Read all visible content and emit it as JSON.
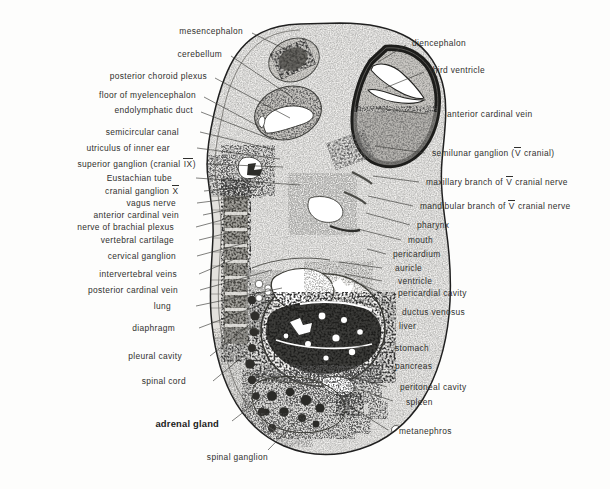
{
  "plate": {
    "width": 610,
    "height": 489,
    "background": "#fdfdfc",
    "ink": "#30302e",
    "specimen_name": "mammalian embryo sagittal section",
    "description": "Histological sagittal section of a mammalian embryo with labelled leader lines."
  },
  "labels_left": [
    {
      "text": "mesencephalon",
      "x": 243,
      "y": 31,
      "lx": 252,
      "ly": 33,
      "tx": 297,
      "ty": 55
    },
    {
      "text": "cerebellum",
      "x": 222,
      "y": 54,
      "lx": 231,
      "ly": 56,
      "tx": 292,
      "ty": 97
    },
    {
      "text": "posterior  choroid plexus",
      "x": 207,
      "y": 76,
      "lx": 215,
      "ly": 78,
      "tx": 290,
      "ty": 118
    },
    {
      "text": "floor of myelencephalon",
      "x": 196,
      "y": 95,
      "lx": 204,
      "ly": 97,
      "tx": 262,
      "ty": 128
    },
    {
      "text": "endolymphatic  duct",
      "x": 193,
      "y": 110,
      "lx": 201,
      "ly": 112,
      "tx": 273,
      "ty": 140
    },
    {
      "text": "semicircular canal",
      "x": 179,
      "y": 132,
      "lx": 200,
      "ly": 132,
      "tx": 275,
      "ty": 150
    },
    {
      "text": "utriculus  of inner ear",
      "x": 170,
      "y": 148,
      "lx": 197,
      "ly": 148,
      "tx": 280,
      "ty": 159
    },
    {
      "text": "superior ganglion (cranial IX)",
      "x": 196,
      "y": 164,
      "lx": 206,
      "ly": 164,
      "tx": 283,
      "ty": 167,
      "roman": "IX"
    },
    {
      "text": "Eustachian tube",
      "x": 172,
      "y": 178,
      "lx": 196,
      "ly": 178,
      "tx": 300,
      "ty": 185
    },
    {
      "text": "cranial  ganglion X",
      "x": 179,
      "y": 191,
      "lx": 204,
      "ly": 191,
      "tx": 256,
      "ty": 186,
      "roman": "X"
    },
    {
      "text": "vagus nerve",
      "x": 176,
      "y": 203,
      "lx": 197,
      "ly": 203,
      "tx": 252,
      "ty": 196
    },
    {
      "text": "anterior cardinal vein",
      "x": 179,
      "y": 215,
      "lx": 203,
      "ly": 215,
      "tx": 236,
      "ty": 208
    },
    {
      "text": "nerve of brachial  plexus",
      "x": 174,
      "y": 227,
      "lx": 196,
      "ly": 227,
      "tx": 226,
      "ty": 219
    },
    {
      "text": "vertebral cartilage",
      "x": 174,
      "y": 240,
      "lx": 199,
      "ly": 240,
      "tx": 232,
      "ty": 232
    },
    {
      "text": "cervical ganglion",
      "x": 176,
      "y": 256,
      "lx": 197,
      "ly": 256,
      "tx": 245,
      "ty": 243
    },
    {
      "text": "intervertebral veins",
      "x": 177,
      "y": 274,
      "lx": 199,
      "ly": 274,
      "tx": 237,
      "ty": 258
    },
    {
      "text": "posterior cardinal vein",
      "x": 178,
      "y": 290,
      "lx": 200,
      "ly": 290,
      "tx": 272,
      "ty": 270
    },
    {
      "text": "lung",
      "x": 171,
      "y": 306,
      "lx": 196,
      "ly": 306,
      "tx": 282,
      "ty": 288
    },
    {
      "text": "diaphragm",
      "x": 175,
      "y": 328,
      "lx": 199,
      "ly": 328,
      "tx": 273,
      "ty": 300
    },
    {
      "text": "pleural cavity",
      "x": 182,
      "y": 356,
      "lx": 210,
      "ly": 356,
      "tx": 253,
      "ty": 322
    },
    {
      "text": "spinal cord",
      "x": 186,
      "y": 381,
      "lx": 213,
      "ly": 381,
      "tx": 248,
      "ty": 352
    },
    {
      "text": "adrenal gland",
      "x": 219,
      "y": 424,
      "lx": 232,
      "ly": 421,
      "tx": 272,
      "ty": 390,
      "bold": true
    },
    {
      "text": "spinal ganglion",
      "x": 268,
      "y": 457,
      "lx": 268,
      "ly": 450,
      "tx": 303,
      "ty": 414
    }
  ],
  "labels_right": [
    {
      "text": "diencephalon",
      "x": 412,
      "y": 43,
      "lx": 406,
      "ly": 45,
      "tx": 378,
      "ty": 62
    },
    {
      "text": "third ventricle",
      "x": 430,
      "y": 70,
      "lx": 424,
      "ly": 72,
      "tx": 385,
      "ty": 88
    },
    {
      "text": "anterior cardinal vein",
      "x": 447,
      "y": 114,
      "lx": 428,
      "ly": 114,
      "tx": 376,
      "ty": 108
    },
    {
      "text": "semilunar ganglion (V cranial)",
      "x": 432,
      "y": 153,
      "lx": 425,
      "ly": 153,
      "tx": 375,
      "ty": 146,
      "roman": "V"
    },
    {
      "text": "maxillary branch of V cranial nerve",
      "x": 426,
      "y": 182,
      "lx": 419,
      "ly": 182,
      "tx": 373,
      "ty": 176,
      "roman": "V"
    },
    {
      "text": "mandibular  branch of V cranial nerve",
      "x": 420,
      "y": 206,
      "lx": 413,
      "ly": 206,
      "tx": 368,
      "ty": 196,
      "roman": "V"
    },
    {
      "text": "pharynx",
      "x": 417,
      "y": 225,
      "lx": 410,
      "ly": 225,
      "tx": 366,
      "ty": 213
    },
    {
      "text": "mouth",
      "x": 408,
      "y": 240,
      "lx": 401,
      "ly": 240,
      "tx": 358,
      "ty": 229
    },
    {
      "text": "pericardium",
      "x": 393,
      "y": 254,
      "lx": 386,
      "ly": 254,
      "tx": 367,
      "ty": 249
    },
    {
      "text": "auricle",
      "x": 395,
      "y": 268,
      "lx": 382,
      "ly": 268,
      "tx": 339,
      "ty": 262
    },
    {
      "text": "ventricle",
      "x": 398,
      "y": 281,
      "lx": 382,
      "ly": 281,
      "tx": 345,
      "ty": 274
    },
    {
      "text": "pericardial cavity",
      "x": 398,
      "y": 293,
      "lx": 382,
      "ly": 293,
      "tx": 352,
      "ty": 281
    },
    {
      "text": "ductus venosus",
      "x": 402,
      "y": 312,
      "lx": 388,
      "ly": 311,
      "tx": 355,
      "ty": 300
    },
    {
      "text": "liver",
      "x": 399,
      "y": 326,
      "lx": 383,
      "ly": 326,
      "tx": 349,
      "ty": 320
    },
    {
      "text": "stomach",
      "x": 395,
      "y": 348,
      "lx": 380,
      "ly": 348,
      "tx": 339,
      "ty": 344
    },
    {
      "text": "pancreas",
      "x": 395,
      "y": 366,
      "lx": 380,
      "ly": 366,
      "tx": 329,
      "ty": 362
    },
    {
      "text": "peritoneal  cavity",
      "x": 400,
      "y": 387,
      "lx": 387,
      "ly": 387,
      "tx": 344,
      "ty": 374
    },
    {
      "text": "spleen",
      "x": 406,
      "y": 402,
      "lx": 393,
      "ly": 401,
      "tx": 348,
      "ty": 386
    },
    {
      "text": "metanephros",
      "x": 399,
      "y": 431,
      "lx": 388,
      "ly": 430,
      "tx": 340,
      "ty": 400
    }
  ]
}
